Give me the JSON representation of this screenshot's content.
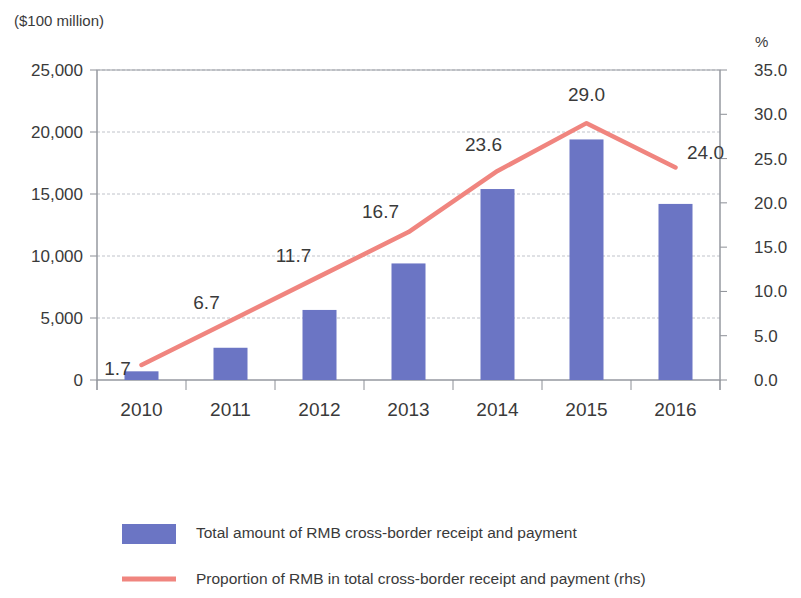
{
  "chart_data": {
    "type": "bar",
    "title": "",
    "subtitle": "",
    "categories": [
      "2010",
      "2011",
      "2012",
      "2013",
      "2014",
      "2015",
      "2016"
    ],
    "xlabel": "",
    "ylabel": "($100 million)",
    "y2label": "%",
    "ylim": [
      0,
      25000
    ],
    "y2lim": [
      0,
      35
    ],
    "yticks": [
      "0",
      "5,000",
      "10,000",
      "15,000",
      "20,000",
      "25,000"
    ],
    "ytick_values": [
      0,
      5000,
      10000,
      15000,
      20000,
      25000
    ],
    "y2ticks": [
      "0.0",
      "5.0",
      "10.0",
      "15.0",
      "20.0",
      "25.0",
      "30.0",
      "35.0"
    ],
    "y2tick_values": [
      0,
      5,
      10,
      15,
      20,
      25,
      30,
      35
    ],
    "grid": true,
    "legend_position": "bottom",
    "series": [
      {
        "name": "Total amount of RMB cross-border receipt and payment",
        "type": "bar",
        "axis": "left",
        "color": "#6B75C4",
        "values": [
          700,
          2600,
          5650,
          9400,
          15400,
          19400,
          14200
        ],
        "labels": [
          "",
          "",
          "",
          "",
          "",
          "",
          ""
        ]
      },
      {
        "name": "Proportion of RMB in total cross-border receipt and payment (rhs)",
        "type": "line",
        "axis": "right",
        "color": "#F0857F",
        "values": [
          1.7,
          6.7,
          11.7,
          16.7,
          23.6,
          29.0,
          24.0
        ],
        "labels": [
          "1.7",
          "6.7",
          "11.7",
          "16.7",
          "23.6",
          "29.0",
          "24.0"
        ]
      }
    ]
  },
  "legend": {
    "items": [
      {
        "marker": "bar-swatch",
        "label": "Total amount of RMB cross-border receipt and payment",
        "color": "#6B75C4"
      },
      {
        "marker": "line-swatch",
        "label": "Proportion of RMB in total cross-border receipt and payment (rhs)",
        "color": "#F0857F"
      }
    ]
  }
}
